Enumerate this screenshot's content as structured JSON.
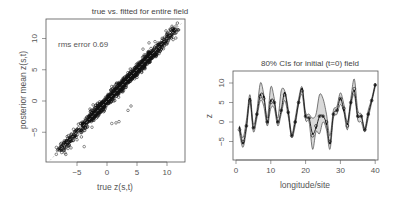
{
  "chart_data": [
    {
      "type": "scatter",
      "title": "true vs. fitted for entire field",
      "xlabel": "true z(s,t)",
      "ylabel": "posterior mean z(s,t)",
      "annotation": "rms error 0.69",
      "xlim": [
        -9.5,
        13
      ],
      "ylim": [
        -10,
        13.5
      ],
      "xticks": [
        -5,
        0,
        5,
        10
      ],
      "yticks": [
        -5,
        0,
        5,
        10
      ],
      "reference_line": "y = x (dashed, light gray)",
      "grid": false,
      "point_style": "open circles, dense along diagonal",
      "description": "Thousands of points tightly clustered along y=x from about -8 to 12"
    },
    {
      "type": "line",
      "title": "80% CIs for initial (t=0) field",
      "xlabel": "longitude/site",
      "ylabel": "z",
      "xlim": [
        -1,
        41
      ],
      "ylim": [
        -10,
        13
      ],
      "xticks": [
        0,
        10,
        20,
        30,
        40
      ],
      "yticks": [
        -5,
        0,
        5,
        10
      ],
      "grid": false,
      "x": [
        1,
        2,
        3,
        4,
        5,
        6,
        7,
        8,
        9,
        10,
        11,
        12,
        13,
        14,
        15,
        16,
        17,
        18,
        19,
        20,
        21,
        22,
        23,
        24,
        25,
        26,
        27,
        28,
        29,
        30,
        31,
        32,
        33,
        34,
        35,
        36,
        37,
        38,
        39,
        40
      ],
      "series": [
        {
          "name": "posterior mean",
          "values": [
            -2,
            -5,
            -1,
            5.5,
            -1.5,
            2,
            6.5,
            6,
            0,
            5,
            5,
            0,
            3,
            7,
            2.5,
            -3.5,
            0,
            5,
            8,
            1.5,
            1,
            -3.5,
            -1,
            1.5,
            1.5,
            0,
            -5,
            2,
            3,
            6,
            3.5,
            -1,
            5,
            8.5,
            1.5,
            1.5,
            -2,
            2,
            5.5,
            9.5
          ]
        },
        {
          "name": "upper 80% CI",
          "values": [
            -1,
            -4,
            0.5,
            7,
            -0.5,
            3,
            10,
            7,
            1,
            9,
            6,
            1,
            8,
            8,
            3.5,
            -3,
            1,
            6,
            9,
            2.5,
            2,
            1,
            2,
            7,
            6,
            2,
            -3.5,
            3,
            4,
            7.5,
            4.5,
            0,
            6,
            11,
            3,
            2,
            -1.5,
            3,
            6,
            10
          ]
        },
        {
          "name": "lower 80% CI",
          "values": [
            -3,
            -6.5,
            -2,
            5,
            -2.5,
            1,
            5.5,
            4,
            -1,
            3.5,
            3.5,
            -1,
            2,
            5.5,
            1.5,
            -4,
            -1,
            4.5,
            7,
            0.5,
            0,
            -7,
            -2.5,
            -3,
            0,
            -2,
            -7,
            1,
            2,
            4.5,
            2.5,
            -2,
            4,
            7,
            0.5,
            0,
            -2.5,
            1,
            5,
            9
          ]
        },
        {
          "name": "true field",
          "values": [
            -1.5,
            -5.5,
            -1,
            6,
            -1.5,
            2,
            7,
            6.5,
            0,
            5.5,
            5,
            0,
            3,
            7.5,
            2.5,
            -3.5,
            0,
            5,
            8.5,
            1.5,
            1,
            -3,
            -1.5,
            1.5,
            1.5,
            -0.5,
            -5.5,
            2,
            3,
            6,
            3,
            -0.5,
            5,
            8,
            1.5,
            1.5,
            -2,
            2,
            5.5,
            9.5
          ]
        }
      ],
      "band_fill": "#d9d9d9"
    }
  ],
  "left_chart": {
    "title": "true vs. fitted for entire field",
    "annotation": "rms error 0.69",
    "xlabel": "true z(s,t)",
    "ylabel": "posterior mean z(s,t)",
    "xtick_labels": [
      "-5",
      "0",
      "5",
      "10"
    ],
    "ytick_labels": [
      "-5",
      "0",
      "5",
      "10"
    ]
  },
  "right_chart": {
    "title": "80% CIs for initial (t=0) field",
    "xlabel": "longitude/site",
    "ylabel": "z",
    "xtick_labels": [
      "0",
      "10",
      "20",
      "30",
      "40"
    ],
    "ytick_labels": [
      "-5",
      "0",
      "5",
      "10"
    ]
  },
  "colors": {
    "points": "#111111",
    "frame": "#555555",
    "band": "#d9d9d9",
    "refline": "#bbbbbb"
  }
}
